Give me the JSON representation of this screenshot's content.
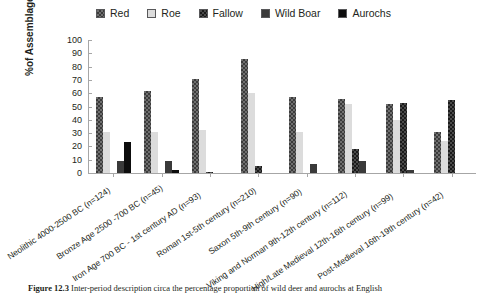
{
  "chart_data": {
    "type": "bar",
    "title": "",
    "xlabel": "",
    "ylabel": "%of Assemblages",
    "ylim": [
      0,
      100
    ],
    "yticks": [
      100,
      90,
      80,
      70,
      60,
      50,
      40,
      30,
      20,
      10,
      0
    ],
    "grid": false,
    "legend_position": "top-center",
    "categories": [
      "Neolithic 4000-2500 BC (n=124)",
      "Bronze Age 2500 -700 BC (n=45)",
      "Iron Age 700 BC - 1st century AD (n=93)",
      "Roman 1st-5th century (n=210)",
      "Saxon 5th-9th century (n=90)",
      "Viking and Norman 9th-12th century (n=112)",
      "High/Late Medieval 12th-16th century (n=99)",
      "Post-Medieval 16th-19th century (n=42)"
    ],
    "series": [
      {
        "name": "Red",
        "color": "#6f6f6f",
        "values": [
          57,
          62,
          71,
          86,
          57,
          56,
          52,
          31
        ]
      },
      {
        "name": "Roe",
        "color": "#dcdcdc",
        "values": [
          31,
          31,
          32,
          60,
          31,
          52,
          40,
          24
        ]
      },
      {
        "name": "Fallow",
        "color": "#4a4a4a",
        "values": [
          0,
          0,
          1,
          5,
          0,
          18,
          53,
          55
        ]
      },
      {
        "name": "Wild Boar",
        "color": "#3a3a3a",
        "values": [
          9,
          9,
          0,
          0,
          7,
          9,
          2,
          0
        ]
      },
      {
        "name": "Aurochs",
        "color": "#0d0d0d",
        "values": [
          23,
          2,
          0,
          0,
          0,
          0,
          0,
          0
        ]
      }
    ]
  },
  "legend": {
    "items": [
      {
        "label": "Red",
        "swatch": "red-swatch"
      },
      {
        "label": "Roe",
        "swatch": "roe-swatch"
      },
      {
        "label": "Fallow",
        "swatch": "fallow-swatch"
      },
      {
        "label": "Wild Boar",
        "swatch": "wild-boar-swatch"
      },
      {
        "label": "Aurochs",
        "swatch": "aurochs-swatch"
      }
    ]
  },
  "axis": {
    "y_label": "%of Assemblages",
    "y_ticks": [
      "100",
      "90",
      "80",
      "70",
      "60",
      "50",
      "40",
      "30",
      "20",
      "10",
      "0"
    ]
  },
  "caption": {
    "number": "Figure 12.3",
    "text": "Inter-period description circa the percentage proportion of wild deer and aurochs at English"
  }
}
